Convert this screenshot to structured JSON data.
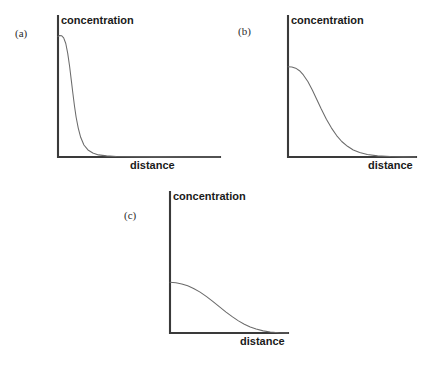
{
  "figure": {
    "background_color": "#ffffff",
    "axis_color": "#3a3a3a",
    "curve_color": "#6b6b6b",
    "label_color": "#1a1a1a"
  },
  "panels": [
    {
      "tag": "(a)",
      "ylabel": "concentration",
      "xlabel": "distance",
      "tag_pos": {
        "x": 15,
        "y": 28
      },
      "origin": {
        "x": 58,
        "y": 157
      },
      "x_axis_end": 220,
      "y_axis_top": 16,
      "ylabel_pos": {
        "x": 61,
        "y": 15
      },
      "xlabel_pos": {
        "x": 130,
        "y": 160
      }
    },
    {
      "tag": "(b)",
      "ylabel": "concentration",
      "xlabel": "distance",
      "tag_pos": {
        "x": 238,
        "y": 26
      },
      "origin": {
        "x": 288,
        "y": 157
      },
      "x_axis_end": 416,
      "y_axis_top": 16,
      "ylabel_pos": {
        "x": 291,
        "y": 15
      },
      "xlabel_pos": {
        "x": 368,
        "y": 160
      }
    },
    {
      "tag": "(c)",
      "ylabel": "concentration",
      "xlabel": "distance",
      "tag_pos": {
        "x": 124,
        "y": 210
      },
      "origin": {
        "x": 170,
        "y": 333
      },
      "x_axis_end": 288,
      "y_axis_top": 192,
      "ylabel_pos": {
        "x": 173,
        "y": 191
      },
      "xlabel_pos": {
        "x": 240,
        "y": 336
      }
    }
  ],
  "chart_data": [
    {
      "type": "line",
      "panel": "(a)",
      "title": "",
      "xlabel": "distance",
      "ylabel": "concentration",
      "grid": false,
      "legend": "none",
      "xlim": [
        0,
        1
      ],
      "ylim": [
        0,
        1
      ],
      "description": "Very sharp, steep exponential-like decay: concentration stays high only immediately next to the source then falls almost vertically to zero within a short distance.",
      "series": [
        {
          "name": "concentration profile",
          "x": [
            0.0,
            0.01,
            0.022,
            0.035,
            0.048,
            0.06,
            0.072,
            0.082,
            0.092,
            0.102,
            0.112,
            0.125,
            0.14,
            0.16,
            0.185,
            0.215,
            0.25,
            0.3,
            0.36,
            0.45,
            0.6,
            0.8,
            1.0
          ],
          "y": [
            0.855,
            0.862,
            0.86,
            0.845,
            0.805,
            0.735,
            0.64,
            0.545,
            0.45,
            0.36,
            0.282,
            0.205,
            0.14,
            0.085,
            0.05,
            0.028,
            0.015,
            0.008,
            0.004,
            0.002,
            0.001,
            0.0,
            0.0
          ]
        }
      ]
    },
    {
      "type": "line",
      "panel": "(b)",
      "title": "",
      "xlabel": "distance",
      "ylabel": "concentration",
      "grid": false,
      "legend": "none",
      "xlim": [
        0,
        1
      ],
      "ylim": [
        0,
        1
      ],
      "description": "Intermediate sigmoid decay: concentration begins at a moderate plateau, then falls through an inflection near one third of the distance range and flattens to zero.",
      "series": [
        {
          "name": "concentration profile",
          "x": [
            0.0,
            0.03,
            0.06,
            0.09,
            0.12,
            0.155,
            0.19,
            0.225,
            0.26,
            0.3,
            0.34,
            0.38,
            0.42,
            0.465,
            0.51,
            0.56,
            0.62,
            0.7,
            0.8,
            0.9,
            1.0
          ],
          "y": [
            0.64,
            0.638,
            0.63,
            0.612,
            0.582,
            0.535,
            0.475,
            0.408,
            0.34,
            0.268,
            0.205,
            0.152,
            0.11,
            0.076,
            0.05,
            0.032,
            0.018,
            0.008,
            0.003,
            0.001,
            0.0
          ]
        }
      ]
    },
    {
      "type": "line",
      "panel": "(c)",
      "title": "",
      "xlabel": "distance",
      "ylabel": "concentration",
      "grid": false,
      "legend": "none",
      "xlim": [
        0,
        1
      ],
      "ylim": [
        0,
        1
      ],
      "description": "Gradual sigmoid decay: concentration starts low-to-moderate, declines slowly and smoothly over most of the distance range before levelling off at zero.",
      "series": [
        {
          "name": "concentration profile",
          "x": [
            0.0,
            0.05,
            0.1,
            0.15,
            0.2,
            0.255,
            0.31,
            0.365,
            0.42,
            0.475,
            0.53,
            0.58,
            0.63,
            0.68,
            0.73,
            0.79,
            0.85,
            0.92,
            1.0
          ],
          "y": [
            0.36,
            0.356,
            0.348,
            0.335,
            0.316,
            0.29,
            0.258,
            0.222,
            0.185,
            0.148,
            0.114,
            0.086,
            0.062,
            0.043,
            0.028,
            0.015,
            0.007,
            0.002,
            0.0
          ]
        }
      ]
    }
  ]
}
